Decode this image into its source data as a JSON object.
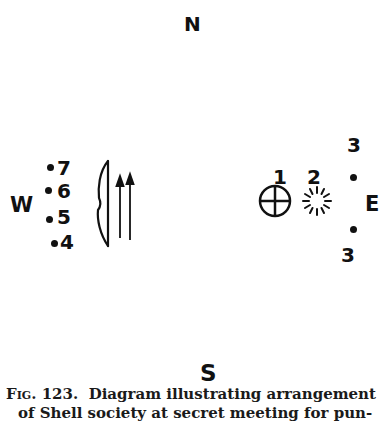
{
  "compass": {
    "north": "N",
    "south": "S",
    "west": "W",
    "east": "E"
  },
  "west_group": {
    "members": [
      {
        "label": "7"
      },
      {
        "label": "6"
      },
      {
        "label": "5"
      },
      {
        "label": "4"
      }
    ],
    "bow_icon": "bow-icon",
    "arrows_icon": "two-arrows-icon"
  },
  "east_group": {
    "member_1": {
      "label": "1",
      "symbol": "circled-cross-icon"
    },
    "member_2": {
      "label": "2",
      "symbol": "sun-burst-icon"
    },
    "member_3_top": {
      "label": "3"
    },
    "member_3_bottom": {
      "label": "3"
    }
  },
  "caption": {
    "fig_label": "Fig. 123.",
    "line1": "Diagram illustrating arrangement",
    "line2": "of Shell society at secret meeting for pun-"
  }
}
